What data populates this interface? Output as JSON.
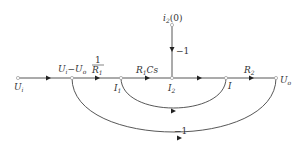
{
  "diagram": {
    "type": "signal-flow-graph",
    "nodes": [
      {
        "id": "Ui",
        "label": "U",
        "sub": "i",
        "x": 18,
        "y": 78
      },
      {
        "id": "UiUo",
        "label": "U",
        "sub": "i",
        "label2": "−U",
        "sub2": "o",
        "x": 72,
        "y": 78
      },
      {
        "id": "I1",
        "label": "I",
        "sub": "1",
        "x": 121,
        "y": 78
      },
      {
        "id": "I2",
        "label": "I",
        "sub": "2",
        "x": 172,
        "y": 78
      },
      {
        "id": "I",
        "label": "I",
        "x": 226,
        "y": 78
      },
      {
        "id": "Uo",
        "label": "U",
        "sub": "o",
        "x": 276,
        "y": 78
      },
      {
        "id": "i20",
        "label": "i",
        "sub": "2",
        "suffix": "(0)",
        "x": 172,
        "y": 25
      }
    ],
    "branches": [
      {
        "from": "Ui",
        "to": "UiUo",
        "gain": ""
      },
      {
        "from": "UiUo",
        "to": "I1",
        "gain": "1/R1",
        "gain_num": "1",
        "gain_den": "R",
        "gain_den_sub": "1"
      },
      {
        "from": "I1",
        "to": "I2",
        "gain": "R1Cs",
        "gain_main": "R",
        "gain_sub": "1",
        "gain_tail": "Cs"
      },
      {
        "from": "i20",
        "to": "I2",
        "gain": "−1"
      },
      {
        "from": "I2",
        "to": "I",
        "gain": ""
      },
      {
        "from": "I",
        "to": "Uo",
        "gain": "R2",
        "gain_main": "R",
        "gain_sub": "2"
      },
      {
        "from": "I",
        "to": "I1",
        "gain": "",
        "type": "feedback-inner"
      },
      {
        "from": "Uo",
        "to": "UiUo",
        "gain": "−1",
        "type": "feedback-outer"
      }
    ]
  }
}
